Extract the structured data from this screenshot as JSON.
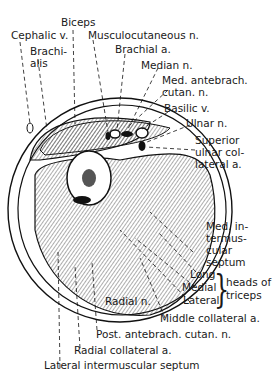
{
  "figure": {
    "labels": {
      "biceps": "Biceps",
      "cephalic_v": "Cephalic v.",
      "musculocutaneous_n": "Musculocutaneous n.",
      "brachialis_1": "Brachi-",
      "brachialis_2": "alis",
      "brachial_a": "Brachial a.",
      "median_n": "Median n.",
      "med_antebrach_1": "Med. antebrach.",
      "med_antebrach_2": "cutan. n.",
      "basilic_v": "Basilic v.",
      "ulnar_n": "Ulnar n.",
      "sup_ulnar_1": "Superior",
      "sup_ulnar_2": "ulnar col-",
      "sup_ulnar_3": "lateral a.",
      "med_intermusc_1": "Med. in-",
      "med_intermusc_2": "termus-",
      "med_intermusc_3": "cular",
      "med_intermusc_4": "septum",
      "long": "Long",
      "medial": "Medial",
      "lateral": "Lateral",
      "heads_of": "heads of",
      "triceps": "triceps",
      "radial_n": "Radial n.",
      "middle_collateral_a": "Middle collateral a.",
      "post_antebrach": "Post. antebrach. cutan. n.",
      "radial_collateral_a": "Radial collateral a.",
      "lateral_intermuscular_septum": "Lateral intermuscular septum"
    }
  }
}
